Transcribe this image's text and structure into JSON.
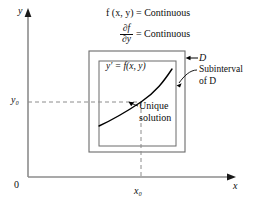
{
  "figure": {
    "title_equations": {
      "eq_top": "f (x, y) = Continuous",
      "eq_frac_num": "∂f",
      "eq_frac_den": "∂y",
      "eq_frac_rhs": "= Continuous"
    },
    "axes": {
      "y_label": "y",
      "x_label": "x",
      "origin_label": "0",
      "y0_label": "y₀",
      "x0_label": "x₀"
    },
    "inner_box": {
      "equation": "y′ = f(x, y)"
    },
    "callouts": {
      "domain_label": "D",
      "subinterval_line1": "Subinterval",
      "subinterval_line2": "of D",
      "unique_line1": "Unique",
      "unique_line2": "solution"
    },
    "colors": {
      "axis": "#8c8c8c",
      "box_stroke": "#6b6b6b",
      "curve": "#000000",
      "dashed": "#8c8c8c",
      "text": "#0d0d0d",
      "background": "#ffffff"
    },
    "geometry": {
      "outer_box": {
        "x": 89,
        "y": 51,
        "w": 96,
        "h": 101
      },
      "inner_box": {
        "x": 99,
        "y": 61,
        "w": 77,
        "h": 85
      },
      "x0_px": 141,
      "y0_px": 102,
      "x_axis_y_px": 177,
      "y_axis_x_px": 28
    }
  }
}
